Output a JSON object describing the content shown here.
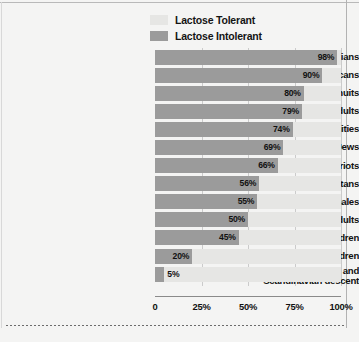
{
  "legend": {
    "items": [
      {
        "label": "Lactose Tolerant",
        "color": "#e6e6e4",
        "key": "tolerant"
      },
      {
        "label": "Lactose Intolerant",
        "color": "#9b9b9b",
        "key": "intolerant"
      }
    ]
  },
  "chart_data": {
    "type": "bar",
    "orientation": "horizontal",
    "stacked": true,
    "title": "",
    "subtitle": "",
    "xlabel": "",
    "ylabel": "",
    "xlim": [
      0,
      100
    ],
    "xticks": [
      0,
      25,
      50,
      75,
      100
    ],
    "xtick_labels": [
      "0",
      "25%",
      "50%",
      "75%",
      "100%"
    ],
    "grid": true,
    "legend_position": "top",
    "value_suffix": "%",
    "categories": [
      "Southeast Asians",
      "Asian Americans",
      "Alaskan Inuits",
      "African American adults",
      "Mexicans from rural communities",
      "North American Jews",
      "Greek Cypriots",
      "Cretans",
      "Mexican American males",
      "Indian adults",
      "African American children",
      "Indian children",
      "Caucasians of north-European and Scandinavian descent"
    ],
    "series": [
      {
        "name": "Lactose Intolerant",
        "color": "#9b9b9b",
        "values": [
          98,
          90,
          80,
          79,
          74,
          69,
          66,
          56,
          55,
          50,
          45,
          20,
          5
        ]
      },
      {
        "name": "Lactose Tolerant",
        "color": "#e6e6e4",
        "values": [
          2,
          10,
          20,
          21,
          26,
          31,
          34,
          44,
          45,
          50,
          55,
          80,
          95
        ]
      }
    ],
    "data_labels": [
      "98%",
      "90%",
      "80%",
      "79%",
      "74%",
      "69%",
      "66%",
      "56%",
      "55%",
      "50%",
      "45%",
      "20%",
      "5%"
    ]
  }
}
